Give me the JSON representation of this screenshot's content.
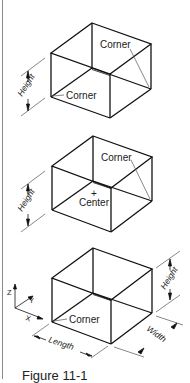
{
  "figures": [
    {
      "id": "box-1",
      "labels": {
        "corner_top": "Corner",
        "corner_bottom": "Corner",
        "height": "Height"
      }
    },
    {
      "id": "box-2",
      "labels": {
        "corner_top": "Corner",
        "center": "Center",
        "center_mark": "+",
        "height": "Height"
      }
    },
    {
      "id": "box-3",
      "labels": {
        "corner": "Corner",
        "height": "Height",
        "width": "Width",
        "length": "Length"
      },
      "axes": {
        "z": "Z",
        "y": "Y",
        "x": "X"
      }
    }
  ],
  "caption": "Figure 11-1",
  "colors": {
    "line": "#111111",
    "leader": "#555555",
    "border": "#8a8a8a"
  }
}
